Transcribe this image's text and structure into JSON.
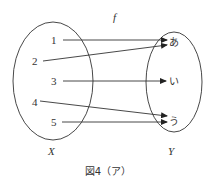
{
  "diagram": {
    "function_label": "f",
    "domain_set": {
      "label": "X",
      "elements": [
        "1",
        "2",
        "3",
        "4",
        "5"
      ]
    },
    "codomain_set": {
      "label": "Y",
      "elements": [
        "あ",
        "い",
        "う"
      ]
    },
    "mappings": [
      {
        "from": "1",
        "to": "あ"
      },
      {
        "from": "2",
        "to": "あ"
      },
      {
        "from": "3",
        "to": "い"
      },
      {
        "from": "4",
        "to": "う"
      },
      {
        "from": "5",
        "to": "う"
      }
    ],
    "caption": "図4（ア）",
    "colors": {
      "stroke": "#333333",
      "background": "#ffffff"
    }
  }
}
